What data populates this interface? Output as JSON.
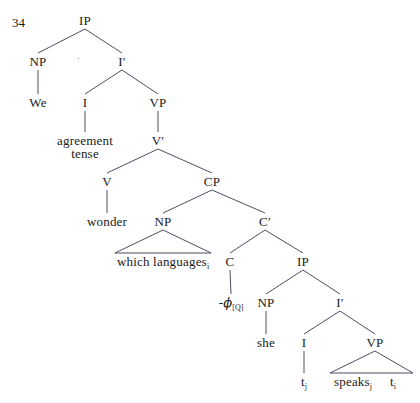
{
  "figure": {
    "number": "34",
    "type": "syntax-tree",
    "width": 420,
    "height": 403,
    "line_color": "#3a3a52",
    "text_color": "#1a1a1a",
    "background": "#ffffff"
  },
  "nodes": [
    {
      "id": "IP1",
      "label": "IP",
      "x": 85,
      "y": 14,
      "kind": "nonterminal"
    },
    {
      "id": "NP1",
      "label": "NP",
      "x": 38,
      "y": 55,
      "kind": "nonterminal"
    },
    {
      "id": "Ibar1",
      "label": "I′",
      "x": 122,
      "y": 55,
      "kind": "nonterminal"
    },
    {
      "id": "We",
      "label": "We",
      "x": 38,
      "y": 96,
      "kind": "terminal"
    },
    {
      "id": "I1",
      "label": "I",
      "x": 85,
      "y": 96,
      "kind": "nonterminal"
    },
    {
      "id": "VP1",
      "label": "VP",
      "x": 158,
      "y": 96,
      "kind": "nonterminal"
    },
    {
      "id": "agrtense",
      "label": "agreement\ntense",
      "x": 85,
      "y": 134,
      "kind": "terminal"
    },
    {
      "id": "Vbar1",
      "label": "V′",
      "x": 158,
      "y": 134,
      "kind": "nonterminal"
    },
    {
      "id": "V1",
      "label": "V",
      "x": 107,
      "y": 175,
      "kind": "nonterminal"
    },
    {
      "id": "CP1",
      "label": "CP",
      "x": 212,
      "y": 175,
      "kind": "nonterminal"
    },
    {
      "id": "wonder",
      "label": "wonder",
      "x": 107,
      "y": 215,
      "kind": "terminal"
    },
    {
      "id": "NP2",
      "label": "NP",
      "x": 163,
      "y": 215,
      "kind": "nonterminal"
    },
    {
      "id": "Cbar1",
      "label": "C′",
      "x": 265,
      "y": 215,
      "kind": "nonterminal"
    },
    {
      "id": "whichlang",
      "label": "which languages",
      "sub": "i",
      "x": 163,
      "y": 255,
      "kind": "terminal"
    },
    {
      "id": "C1",
      "label": "C",
      "x": 230,
      "y": 255,
      "kind": "nonterminal"
    },
    {
      "id": "IP2",
      "label": "IP",
      "x": 303,
      "y": 255,
      "kind": "nonterminal"
    },
    {
      "id": "phiQ",
      "label": "-ϕ",
      "sub": "[Q]",
      "x": 231,
      "y": 296,
      "kind": "terminal"
    },
    {
      "id": "NP3",
      "label": "NP",
      "x": 266,
      "y": 296,
      "kind": "nonterminal"
    },
    {
      "id": "Ibar2",
      "label": "I′",
      "x": 340,
      "y": 296,
      "kind": "nonterminal"
    },
    {
      "id": "she",
      "label": "she",
      "x": 266,
      "y": 336,
      "kind": "terminal"
    },
    {
      "id": "I2",
      "label": "I",
      "x": 304,
      "y": 336,
      "kind": "nonterminal"
    },
    {
      "id": "VP2",
      "label": "VP",
      "x": 375,
      "y": 336,
      "kind": "nonterminal"
    },
    {
      "id": "tj",
      "label": "t",
      "sub": "j",
      "x": 304,
      "y": 375,
      "kind": "terminal"
    },
    {
      "id": "speaksj",
      "label": "speaks",
      "sub": "j",
      "x": 353,
      "y": 375,
      "kind": "terminal"
    },
    {
      "id": "ti",
      "label": "t",
      "sub": "i",
      "x": 393,
      "y": 375,
      "kind": "terminal"
    }
  ],
  "edges": [
    {
      "from": "IP1",
      "to": "NP1",
      "style": "line"
    },
    {
      "from": "IP1",
      "to": "Ibar1",
      "style": "line"
    },
    {
      "from": "NP1",
      "to": "We",
      "style": "line"
    },
    {
      "from": "Ibar1",
      "to": "I1",
      "style": "line"
    },
    {
      "from": "Ibar1",
      "to": "VP1",
      "style": "line"
    },
    {
      "from": "I1",
      "to": "agrtense",
      "style": "line"
    },
    {
      "from": "VP1",
      "to": "Vbar1",
      "style": "line"
    },
    {
      "from": "Vbar1",
      "to": "V1",
      "style": "line"
    },
    {
      "from": "Vbar1",
      "to": "CP1",
      "style": "line"
    },
    {
      "from": "V1",
      "to": "wonder",
      "style": "line"
    },
    {
      "from": "CP1",
      "to": "NP2",
      "style": "line"
    },
    {
      "from": "CP1",
      "to": "Cbar1",
      "style": "line"
    },
    {
      "from": "NP2",
      "to": "whichlang",
      "style": "triangle"
    },
    {
      "from": "Cbar1",
      "to": "C1",
      "style": "line"
    },
    {
      "from": "Cbar1",
      "to": "IP2",
      "style": "line"
    },
    {
      "from": "C1",
      "to": "phiQ",
      "style": "line"
    },
    {
      "from": "IP2",
      "to": "NP3",
      "style": "line"
    },
    {
      "from": "IP2",
      "to": "Ibar2",
      "style": "line"
    },
    {
      "from": "NP3",
      "to": "she",
      "style": "line"
    },
    {
      "from": "Ibar2",
      "to": "I2",
      "style": "line"
    },
    {
      "from": "Ibar2",
      "to": "VP2",
      "style": "line"
    },
    {
      "from": "I2",
      "to": "tj",
      "style": "line"
    },
    {
      "from": "VP2",
      "to": "speaksj",
      "style": "triangle",
      "triangle_span": [
        330,
        413
      ]
    }
  ],
  "sentence": {
    "gloss": "We wonder which languages she speaks."
  }
}
